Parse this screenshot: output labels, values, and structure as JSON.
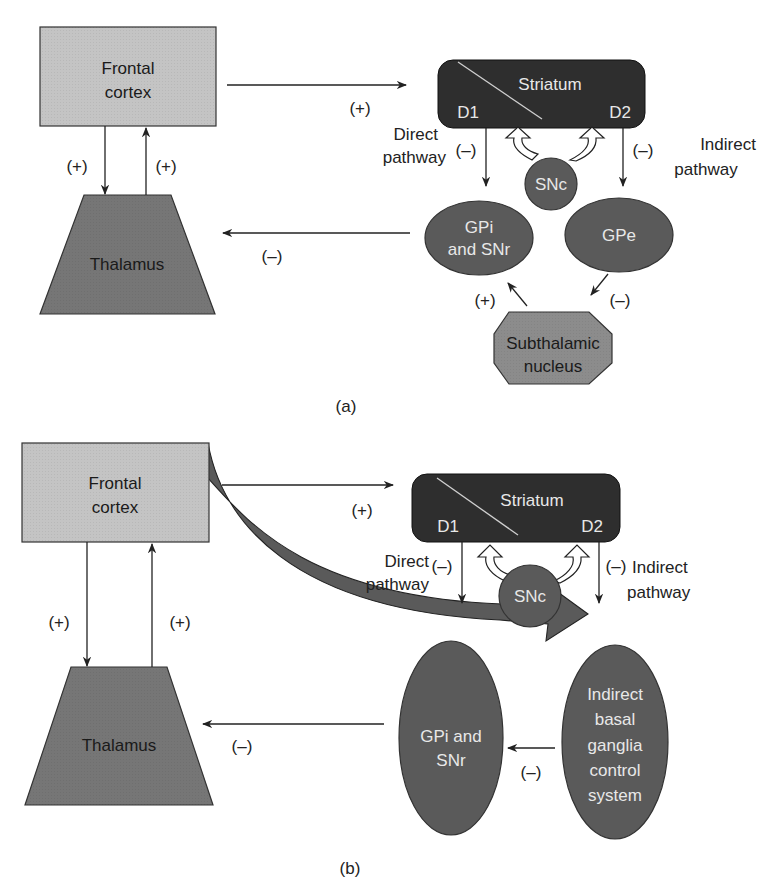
{
  "colors": {
    "frontal_fill": "#c4c4c4",
    "thalamus_fill": "#767676",
    "striatum_fill": "#2e2e2e",
    "nucleus_fill": "#5a5a5a",
    "stn_fill": "#8c8c8c",
    "line": "#222222"
  },
  "panel_a": {
    "caption": "(a)",
    "frontal_cortex": {
      "line1": "Frontal",
      "line2": "cortex"
    },
    "thalamus": "Thalamus",
    "striatum": {
      "title": "Striatum",
      "d1": "D1",
      "d2": "D2"
    },
    "snc": "SNc",
    "gpi_snr": {
      "line1": "GPi",
      "line2": "and SNr"
    },
    "gpe": "GPe",
    "stn": {
      "line1": "Subthalamic",
      "line2": "nucleus"
    },
    "direct_pathway": {
      "line1": "Direct",
      "line2": "pathway"
    },
    "indirect_pathway": {
      "line1": "Indirect",
      "line2": "pathway"
    },
    "signs": {
      "cortex_to_thalamus": "(+)",
      "thalamus_to_cortex": "(+)",
      "cortex_to_striatum": "(+)",
      "gpi_to_thalamus": "(–)",
      "d1_to_gpi": "(–)",
      "d2_to_gpe": "(–)",
      "stn_to_gpi": "(+)",
      "gpe_to_stn": "(–)"
    }
  },
  "panel_b": {
    "caption": "(b)",
    "frontal_cortex": {
      "line1": "Frontal",
      "line2": "cortex"
    },
    "thalamus": "Thalamus",
    "striatum": {
      "title": "Striatum",
      "d1": "D1",
      "d2": "D2"
    },
    "snc": "SNc",
    "gpi_snr": {
      "line1": "GPi and",
      "line2": "SNr"
    },
    "indirect_system": {
      "line1": "Indirect",
      "line2": "basal",
      "line3": "ganglia",
      "line4": "control",
      "line5": "system"
    },
    "direct_pathway": {
      "line1": "Direct",
      "line2": "pathway"
    },
    "indirect_pathway": {
      "line1": "Indirect",
      "line2": "pathway"
    },
    "signs": {
      "cortex_to_thalamus": "(+)",
      "thalamus_to_cortex": "(+)",
      "cortex_to_striatum": "(+)",
      "gpi_to_thalamus": "(–)",
      "d1_down": "(–)",
      "d2_down": "(–)",
      "indirect_to_gpi": "(–)"
    }
  }
}
